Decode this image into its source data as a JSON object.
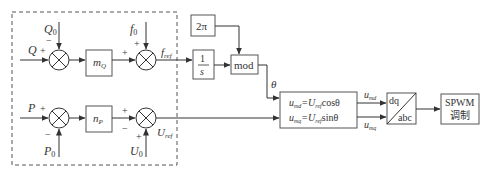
{
  "diagram": {
    "title": "",
    "inputs": {
      "Q": "Q",
      "Q0": "Q",
      "Q0_sub": "0",
      "P": "P",
      "P0": "P",
      "P0_sub": "0",
      "f0": "f",
      "f0_sub": "0",
      "U0": "U",
      "U0_sub": "0"
    },
    "signs": {
      "plus": "+",
      "minus": "−"
    },
    "blocks": {
      "mQ": "m",
      "mQ_sub": "Q",
      "nP": "n",
      "nP_sub": "P",
      "integrator_num": "1",
      "integrator_den": "s",
      "two_pi": "2π",
      "mod": "mod",
      "eq1_lhs": "u",
      "eq1_lhs_sub": "md",
      "eq1_mid": "=U",
      "eq1_mid_sub": "ref",
      "eq1_fn": "cosθ",
      "eq2_lhs": "u",
      "eq2_lhs_sub": "mq",
      "eq2_mid": "=U",
      "eq2_mid_sub": "ref",
      "eq2_fn": "sinθ",
      "dq": "dq",
      "abc": "abc",
      "spwm_line1": "SPWM",
      "spwm_line2": "调制"
    },
    "signals": {
      "fref": "f",
      "fref_sub": "ref",
      "Uref": "U",
      "Uref_sub": "ref",
      "theta": "θ",
      "umd": "u",
      "umd_sub": "md",
      "umq": "u",
      "umq_sub": "mq"
    },
    "colors": {
      "line": "#333333",
      "box_border": "#555555",
      "dashed": "#555555"
    }
  }
}
